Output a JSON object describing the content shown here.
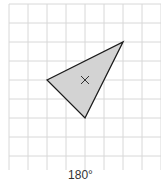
{
  "grid": {
    "cols": 8,
    "rows": 9,
    "origin_x": 9,
    "origin_y": 4,
    "cell": 19,
    "line_color": "#d8d8d8"
  },
  "shape": {
    "type": "triangle",
    "vertices_grid": [
      [
        2,
        4
      ],
      [
        6,
        2
      ],
      [
        4,
        6
      ]
    ],
    "fill": "#d3d3d3",
    "stroke": "#1a1a1a"
  },
  "center_mark": {
    "symbol": "×",
    "grid": [
      4,
      4
    ]
  },
  "caption": {
    "label": "180°"
  }
}
